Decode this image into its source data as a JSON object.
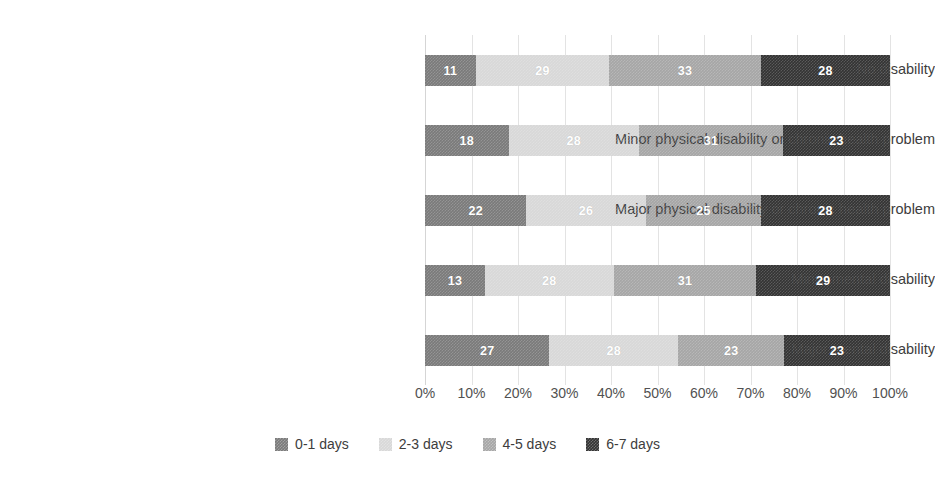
{
  "chart_data": {
    "type": "bar",
    "orientation": "horizontal",
    "stacked": true,
    "normalized": "100%",
    "title": "",
    "xlabel": "",
    "ylabel": "",
    "xlim": [
      0,
      100
    ],
    "grid": true,
    "legend_position": "bottom",
    "categories": [
      "No disability",
      "Minor physical disability or chronic health problem",
      "Major physical disability or chronic health problem",
      "Minor mental disability",
      "Major mental disability"
    ],
    "series": [
      {
        "name": "0-1 days",
        "color": "#7a7a7a",
        "values": [
          11,
          18,
          22,
          13,
          27
        ]
      },
      {
        "name": "2-3 days",
        "color": "#d8d8d8",
        "values": [
          29,
          28,
          26,
          28,
          28
        ]
      },
      {
        "name": "4-5 days",
        "color": "#a6a6a6",
        "values": [
          33,
          31,
          25,
          31,
          23
        ]
      },
      {
        "name": "6-7 days",
        "color": "#333333",
        "values": [
          28,
          23,
          28,
          29,
          23
        ]
      }
    ],
    "xticks": [
      "0%",
      "10%",
      "20%",
      "30%",
      "40%",
      "50%",
      "60%",
      "70%",
      "80%",
      "90%",
      "100%"
    ],
    "xtick_values": [
      0,
      10,
      20,
      30,
      40,
      50,
      60,
      70,
      80,
      90,
      100
    ]
  }
}
